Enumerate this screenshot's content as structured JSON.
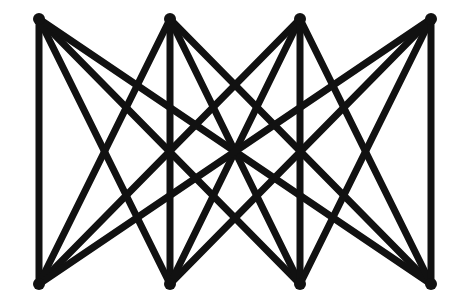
{
  "diagram": {
    "type": "complete-bipartite-graph",
    "name": "K4,4",
    "background": "#ffffff",
    "edge_color": "#111111",
    "node_color": "#111111",
    "edge_width": 7,
    "node_radius": 6,
    "top_nodes": [
      {
        "id": "t1",
        "x": 39,
        "y": 19
      },
      {
        "id": "t2",
        "x": 170,
        "y": 19
      },
      {
        "id": "t3",
        "x": 300,
        "y": 19
      },
      {
        "id": "t4",
        "x": 431,
        "y": 19
      }
    ],
    "bottom_nodes": [
      {
        "id": "b1",
        "x": 39,
        "y": 284
      },
      {
        "id": "b2",
        "x": 170,
        "y": 284
      },
      {
        "id": "b3",
        "x": 300,
        "y": 284
      },
      {
        "id": "b4",
        "x": 431,
        "y": 284
      }
    ]
  }
}
